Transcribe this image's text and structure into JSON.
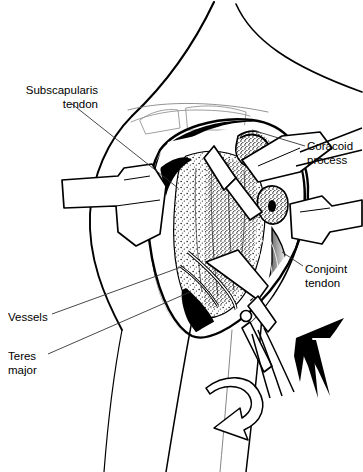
{
  "figure": {
    "type": "medical-surgical-illustration",
    "style": "black and white pen-and-ink line drawing with stipple shading",
    "background_color": "#ffffff",
    "ink_color": "#000000"
  },
  "labels": {
    "subscapularis": "Subscapularis\ntendon",
    "coracoid": "Coracoid\nprocess",
    "conjoint": "Conjoint\ntendon",
    "vessels": "Vessels",
    "teres_major": "Teres\nmajor"
  },
  "annotations": {
    "rotation_arrow": "curved-outline-arrow-external-rotation",
    "direction_arrow": "solid-black-arrow-up-right",
    "instrument": "surgical-scissors-with-hinge-pivot"
  },
  "leader_lines": [
    {
      "from_label": "subscapularis",
      "x1": 72,
      "y1": 104,
      "x2": 178,
      "y2": 188
    },
    {
      "from_label": "coracoid",
      "x1": 305,
      "y1": 146,
      "x2": 252,
      "y2": 130
    },
    {
      "from_label": "conjoint",
      "x1": 303,
      "y1": 266,
      "x2": 282,
      "y2": 252
    },
    {
      "from_label": "vessels",
      "x1": 52,
      "y1": 314,
      "x2": 184,
      "y2": 266
    },
    {
      "from_label": "teres_major",
      "x1": 48,
      "y1": 354,
      "x2": 190,
      "y2": 292
    }
  ]
}
